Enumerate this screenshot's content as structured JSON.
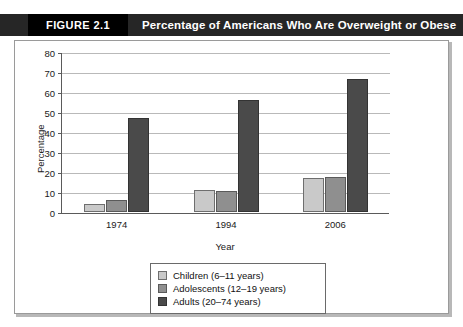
{
  "header": {
    "figure_number": "FIGURE 2.1",
    "title": "Percentage of Americans Who Are Overweight or Obese",
    "bar_color": "#262626",
    "number_block_color": "#000000",
    "text_color": "#ffffff"
  },
  "chart_data": {
    "type": "bar",
    "title": "Percentage of Americans Who Are Overweight or Obese",
    "subtitle": "",
    "xlabel": "Year",
    "ylabel": "Percentage",
    "categories": [
      "1974",
      "1994",
      "2006"
    ],
    "series": [
      {
        "name": "Children (6–11 years)",
        "color": "#c9c9c9",
        "values": [
          4,
          11,
          17
        ]
      },
      {
        "name": "Adolescents (12–19 years)",
        "color": "#8f8f8f",
        "values": [
          6,
          10.5,
          17.5
        ]
      },
      {
        "name": "Adults (20–74 years)",
        "color": "#4a4a4a",
        "values": [
          47,
          56,
          66.5
        ]
      }
    ],
    "ylim": [
      0,
      80
    ],
    "yticks": [
      0,
      10,
      20,
      30,
      40,
      50,
      60,
      70,
      80
    ],
    "ytick_labels": [
      "0",
      "10",
      "20",
      "30",
      "40",
      "50",
      "60",
      "70",
      "80"
    ],
    "grid": true,
    "grid_axis": "y",
    "legend_position": "bottom"
  }
}
